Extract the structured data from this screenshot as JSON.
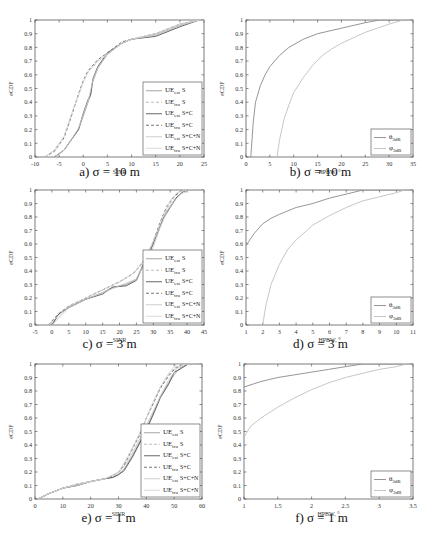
{
  "chart_data": [
    {
      "id": "a",
      "type": "line",
      "caption": "a) σ = 10 m",
      "xlabel": "SINR",
      "ylabel": "eCDF",
      "xlim": [
        -10,
        25
      ],
      "ylim": [
        0,
        1
      ],
      "xticks": [
        -10,
        -5,
        0,
        5,
        10,
        15,
        20,
        25
      ],
      "yticks": [
        0,
        0.1,
        0.2,
        0.3,
        0.4,
        0.5,
        0.6,
        0.7,
        0.8,
        0.9,
        1
      ],
      "legend_position": "lower right",
      "series": [
        {
          "name": "UE_est S",
          "style": "solid",
          "color": "#9a9a9a",
          "x": [
            -6,
            -4,
            -3,
            -1,
            0,
            1,
            1.5,
            2,
            3,
            5,
            8,
            10,
            15,
            20,
            24
          ],
          "y": [
            0,
            0.05,
            0.1,
            0.2,
            0.3,
            0.4,
            0.45,
            0.55,
            0.65,
            0.75,
            0.83,
            0.86,
            0.89,
            0.96,
            1
          ]
        },
        {
          "name": "UE_tru S",
          "style": "dashed",
          "color": "#b5b5b5",
          "x": [
            -8,
            -6,
            -4,
            -3,
            -2,
            -1,
            0,
            1,
            3,
            5,
            8,
            10,
            15,
            20,
            24
          ],
          "y": [
            0,
            0.05,
            0.15,
            0.25,
            0.35,
            0.45,
            0.55,
            0.62,
            0.7,
            0.75,
            0.83,
            0.86,
            0.9,
            0.97,
            1
          ]
        },
        {
          "name": "UE_est S+C",
          "style": "solid",
          "color": "#555555",
          "x": [
            -6,
            -4,
            -3,
            -1,
            0,
            1,
            1.5,
            2,
            3,
            5,
            8,
            10,
            15,
            20,
            24
          ],
          "y": [
            0,
            0.05,
            0.1,
            0.2,
            0.32,
            0.42,
            0.45,
            0.57,
            0.66,
            0.76,
            0.83,
            0.86,
            0.88,
            0.95,
            1
          ]
        },
        {
          "name": "UE_tru S+C",
          "style": "dashed",
          "color": "#666666",
          "x": [
            -8,
            -6,
            -4,
            -3,
            -2,
            -1,
            0,
            1,
            3,
            5,
            8,
            10,
            15,
            20,
            24
          ],
          "y": [
            0,
            0.04,
            0.14,
            0.24,
            0.35,
            0.46,
            0.56,
            0.63,
            0.71,
            0.76,
            0.84,
            0.86,
            0.9,
            0.97,
            1
          ]
        },
        {
          "name": "UE_est S+C+N",
          "style": "solid",
          "color": "#c8c8c8",
          "x": [
            -6,
            -4,
            -3,
            -1,
            0,
            1,
            2,
            3,
            5,
            8,
            10,
            15,
            20,
            24
          ],
          "y": [
            0,
            0.05,
            0.1,
            0.21,
            0.31,
            0.41,
            0.56,
            0.65,
            0.75,
            0.83,
            0.86,
            0.89,
            0.96,
            1
          ]
        },
        {
          "name": "UE_tru S+C+N",
          "style": "solid",
          "color": "#d5d5d5",
          "x": [
            -8,
            -6,
            -4,
            -2,
            -1,
            0,
            1,
            3,
            5,
            8,
            10,
            15,
            20,
            24
          ],
          "y": [
            0,
            0.05,
            0.15,
            0.36,
            0.45,
            0.55,
            0.62,
            0.7,
            0.75,
            0.83,
            0.86,
            0.9,
            0.97,
            1
          ]
        }
      ]
    },
    {
      "id": "b",
      "type": "line",
      "caption": "b) σ = 10 m",
      "xlabel": "HPBW, °",
      "ylabel": "eCDF",
      "xlim": [
        0,
        35
      ],
      "ylim": [
        0,
        1
      ],
      "xticks": [
        0,
        5,
        10,
        15,
        20,
        25,
        30,
        35
      ],
      "yticks": [
        0,
        0.1,
        0.2,
        0.3,
        0.4,
        0.5,
        0.6,
        0.7,
        0.8,
        0.9,
        1
      ],
      "legend_position": "lower right",
      "series": [
        {
          "name": "θ_3dB",
          "style": "solid",
          "color": "#8a8a8a",
          "x": [
            1,
            1.5,
            2,
            3,
            4,
            5,
            7,
            9,
            12,
            15,
            20,
            25,
            28,
            30
          ],
          "y": [
            0,
            0.25,
            0.4,
            0.52,
            0.6,
            0.66,
            0.74,
            0.8,
            0.86,
            0.9,
            0.94,
            0.98,
            1,
            1
          ]
        },
        {
          "name": "φ_3dB",
          "style": "solid",
          "color": "#c0c0c0",
          "x": [
            6.5,
            7,
            8,
            9,
            10,
            12,
            14,
            16,
            18,
            20,
            25,
            30,
            33
          ],
          "y": [
            0,
            0.12,
            0.28,
            0.38,
            0.47,
            0.58,
            0.67,
            0.74,
            0.79,
            0.83,
            0.91,
            0.97,
            1
          ]
        }
      ]
    },
    {
      "id": "c",
      "type": "line",
      "caption": "c) σ = 3 m",
      "xlabel": "SINR",
      "ylabel": "eCDF",
      "xlim": [
        -5,
        45
      ],
      "ylim": [
        0,
        1
      ],
      "xticks": [
        -5,
        0,
        5,
        10,
        15,
        20,
        25,
        30,
        35,
        40,
        45
      ],
      "yticks": [
        0,
        0.1,
        0.2,
        0.3,
        0.4,
        0.5,
        0.6,
        0.7,
        0.8,
        0.9,
        1
      ],
      "legend_position": "lower right",
      "series": [
        {
          "name": "UE_est S",
          "style": "solid",
          "color": "#9a9a9a",
          "x": [
            0,
            2,
            5,
            10,
            15,
            18,
            22,
            25,
            27,
            29,
            31,
            33,
            35,
            37,
            39,
            41
          ],
          "y": [
            0,
            0.08,
            0.13,
            0.19,
            0.24,
            0.28,
            0.3,
            0.34,
            0.45,
            0.55,
            0.68,
            0.8,
            0.88,
            0.95,
            0.99,
            1
          ]
        },
        {
          "name": "UE_tru S",
          "style": "dashed",
          "color": "#b5b5b5",
          "x": [
            -1,
            2,
            5,
            10,
            15,
            20,
            24,
            26,
            28,
            30,
            32,
            34,
            36,
            38,
            40
          ],
          "y": [
            0,
            0.09,
            0.14,
            0.2,
            0.26,
            0.32,
            0.38,
            0.43,
            0.5,
            0.6,
            0.74,
            0.86,
            0.94,
            0.99,
            1
          ]
        },
        {
          "name": "UE_est S+C",
          "style": "solid",
          "color": "#555555",
          "x": [
            0,
            2,
            5,
            10,
            15,
            18,
            22,
            25,
            27,
            29,
            31,
            33,
            35,
            37,
            39,
            41
          ],
          "y": [
            0,
            0.08,
            0.13,
            0.19,
            0.23,
            0.28,
            0.29,
            0.33,
            0.44,
            0.54,
            0.67,
            0.79,
            0.87,
            0.95,
            0.99,
            1
          ]
        },
        {
          "name": "UE_tru S+C",
          "style": "dashed",
          "color": "#666666",
          "x": [
            -1,
            2,
            5,
            10,
            15,
            20,
            24,
            26,
            28,
            30,
            32,
            34,
            36,
            38,
            40
          ],
          "y": [
            0,
            0.08,
            0.14,
            0.2,
            0.26,
            0.32,
            0.38,
            0.44,
            0.51,
            0.62,
            0.76,
            0.88,
            0.95,
            0.99,
            1
          ]
        },
        {
          "name": "UE_est S+C+N",
          "style": "solid",
          "color": "#c8c8c8",
          "x": [
            0,
            5,
            10,
            15,
            20,
            25,
            28,
            30,
            32,
            34,
            36,
            38,
            41
          ],
          "y": [
            0,
            0.13,
            0.19,
            0.24,
            0.29,
            0.34,
            0.48,
            0.58,
            0.72,
            0.84,
            0.91,
            0.97,
            1
          ]
        },
        {
          "name": "UE_tru S+C+N",
          "style": "solid",
          "color": "#d5d5d5",
          "x": [
            -1,
            5,
            10,
            15,
            20,
            24,
            27,
            29,
            31,
            33,
            35,
            37,
            40
          ],
          "y": [
            0,
            0.14,
            0.2,
            0.26,
            0.32,
            0.38,
            0.47,
            0.56,
            0.68,
            0.81,
            0.92,
            0.98,
            1
          ]
        }
      ]
    },
    {
      "id": "d",
      "type": "line",
      "caption": "d) σ = 3 m",
      "xlabel": "HPBW, °",
      "ylabel": "eCDF",
      "xlim": [
        1,
        11
      ],
      "ylim": [
        0,
        1
      ],
      "xticks": [
        1,
        2,
        3,
        4,
        5,
        6,
        7,
        8,
        9,
        10,
        11
      ],
      "yticks": [
        0,
        0.1,
        0.2,
        0.3,
        0.4,
        0.5,
        0.6,
        0.7,
        0.8,
        0.9,
        1
      ],
      "legend_position": "lower right",
      "series": [
        {
          "name": "θ_3dB",
          "style": "solid",
          "color": "#8a8a8a",
          "x": [
            1,
            1.5,
            2,
            2.5,
            3,
            4,
            5,
            6,
            7,
            8
          ],
          "y": [
            0.59,
            0.68,
            0.75,
            0.79,
            0.82,
            0.87,
            0.9,
            0.94,
            0.97,
            1
          ]
        },
        {
          "name": "φ_3dB",
          "style": "solid",
          "color": "#c0c0c0",
          "x": [
            2,
            2.2,
            2.5,
            3,
            3.5,
            4,
            5,
            6,
            7,
            8,
            9,
            10,
            10.5
          ],
          "y": [
            0,
            0.15,
            0.3,
            0.45,
            0.56,
            0.63,
            0.74,
            0.81,
            0.87,
            0.92,
            0.95,
            0.98,
            1
          ]
        }
      ]
    },
    {
      "id": "e",
      "type": "line",
      "caption": "e) σ = 1 m",
      "xlabel": "SINR",
      "ylabel": "eCDF",
      "xlim": [
        0,
        60
      ],
      "ylim": [
        0,
        1
      ],
      "xticks": [
        0,
        10,
        20,
        30,
        40,
        50,
        60
      ],
      "yticks": [
        0,
        0.1,
        0.2,
        0.3,
        0.4,
        0.5,
        0.6,
        0.7,
        0.8,
        0.9,
        1
      ],
      "legend_position": "lower right",
      "series": [
        {
          "name": "UE_est S",
          "style": "solid",
          "color": "#9a9a9a",
          "x": [
            1,
            5,
            10,
            15,
            20,
            25,
            28,
            30,
            32,
            35,
            38,
            40,
            43,
            45,
            48,
            50,
            52,
            55
          ],
          "y": [
            0,
            0.04,
            0.08,
            0.1,
            0.13,
            0.15,
            0.16,
            0.18,
            0.22,
            0.32,
            0.44,
            0.52,
            0.66,
            0.76,
            0.86,
            0.92,
            0.97,
            1
          ]
        },
        {
          "name": "UE_tru S",
          "style": "dashed",
          "color": "#b5b5b5",
          "x": [
            1,
            5,
            10,
            15,
            20,
            25,
            28,
            30,
            32,
            35,
            38,
            40,
            43,
            45,
            48,
            50,
            53
          ],
          "y": [
            0,
            0.04,
            0.08,
            0.11,
            0.13,
            0.15,
            0.17,
            0.2,
            0.26,
            0.38,
            0.5,
            0.6,
            0.74,
            0.83,
            0.92,
            0.97,
            1
          ]
        },
        {
          "name": "UE_est S+C",
          "style": "solid",
          "color": "#555555",
          "x": [
            1,
            5,
            10,
            15,
            20,
            25,
            28,
            30,
            32,
            35,
            38,
            40,
            43,
            45,
            48,
            50,
            52,
            55
          ],
          "y": [
            0,
            0.04,
            0.08,
            0.1,
            0.13,
            0.15,
            0.16,
            0.18,
            0.21,
            0.31,
            0.43,
            0.51,
            0.65,
            0.75,
            0.85,
            0.94,
            0.96,
            1
          ]
        },
        {
          "name": "UE_tru S+C",
          "style": "dashed",
          "color": "#666666",
          "x": [
            1,
            5,
            10,
            15,
            20,
            25,
            28,
            30,
            32,
            35,
            38,
            40,
            43,
            45,
            48,
            50,
            53
          ],
          "y": [
            0,
            0.04,
            0.08,
            0.11,
            0.13,
            0.15,
            0.17,
            0.2,
            0.25,
            0.37,
            0.49,
            0.6,
            0.73,
            0.82,
            0.91,
            0.96,
            1
          ]
        },
        {
          "name": "UE_est S+C+N",
          "style": "solid",
          "color": "#c8c8c8",
          "x": [
            1,
            5,
            10,
            15,
            20,
            25,
            30,
            33,
            36,
            39,
            42,
            45,
            48,
            51,
            54
          ],
          "y": [
            0,
            0.04,
            0.08,
            0.1,
            0.13,
            0.15,
            0.19,
            0.27,
            0.38,
            0.5,
            0.63,
            0.76,
            0.88,
            0.97,
            1
          ]
        },
        {
          "name": "UE_tru S+C+N",
          "style": "solid",
          "color": "#d5d5d5",
          "x": [
            1,
            5,
            10,
            15,
            20,
            25,
            30,
            33,
            36,
            39,
            42,
            45,
            48,
            51
          ],
          "y": [
            0,
            0.04,
            0.08,
            0.11,
            0.13,
            0.15,
            0.2,
            0.3,
            0.42,
            0.55,
            0.7,
            0.83,
            0.93,
            1
          ]
        }
      ]
    },
    {
      "id": "f",
      "type": "line",
      "caption": "f) σ = 1 m",
      "xlabel": "HPBW, °",
      "ylabel": "eCDF",
      "xlim": [
        1,
        3.5
      ],
      "ylim": [
        0,
        1
      ],
      "xticks": [
        1,
        1.5,
        2,
        2.5,
        3,
        3.5
      ],
      "yticks": [
        0,
        0.1,
        0.2,
        0.3,
        0.4,
        0.5,
        0.6,
        0.7,
        0.8,
        0.9,
        1
      ],
      "legend_position": "lower right",
      "series": [
        {
          "name": "θ_3dB",
          "style": "solid",
          "color": "#8a8a8a",
          "x": [
            1,
            1.25,
            1.5,
            1.75,
            2,
            2.25,
            2.5,
            2.75,
            3.5
          ],
          "y": [
            0.83,
            0.87,
            0.9,
            0.92,
            0.94,
            0.96,
            0.98,
            1,
            1
          ]
        },
        {
          "name": "φ_3dB",
          "style": "solid",
          "color": "#c0c0c0",
          "x": [
            1,
            1.1,
            1.25,
            1.5,
            1.75,
            2,
            2.25,
            2.5,
            2.75,
            3,
            3.25,
            3.4
          ],
          "y": [
            0.46,
            0.54,
            0.6,
            0.68,
            0.75,
            0.81,
            0.86,
            0.9,
            0.93,
            0.96,
            0.98,
            1
          ]
        }
      ]
    }
  ]
}
